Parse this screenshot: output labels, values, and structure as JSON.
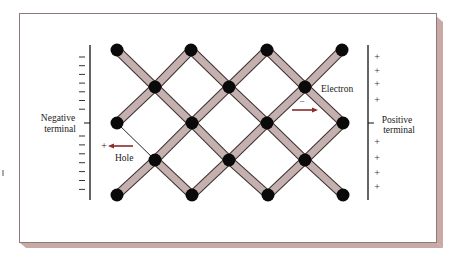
{
  "figure": {
    "labels": {
      "negative_terminal_line1": "Negative",
      "negative_terminal_line2": "terminal",
      "positive_terminal_line1": "Positive",
      "positive_terminal_line2": "terminal",
      "electron": "Electron",
      "hole": "Hole",
      "electron_sign": "–",
      "hole_sign": "+"
    },
    "negative_plate": {
      "sign": "–",
      "count_above": 7,
      "count_below": 7
    },
    "positive_plate": {
      "sign": "+",
      "count_above": 4,
      "count_below": 4
    },
    "colors": {
      "bond_fill": "#c4b0ae",
      "bond_edge": "#3a2e2e",
      "atom": "#0a0a0a",
      "arrow": "#8b2a2a",
      "frame_shadow": "#c9a9a6",
      "frame_line": "#8a7a78"
    },
    "lattice": {
      "atoms": [
        [
          117,
          50
        ],
        [
          191,
          50
        ],
        [
          267,
          50
        ],
        [
          342,
          50
        ],
        [
          155,
          87
        ],
        [
          229,
          87
        ],
        [
          305,
          87
        ],
        [
          117,
          123
        ],
        [
          192,
          123
        ],
        [
          267,
          123
        ],
        [
          343,
          123
        ],
        [
          155,
          160
        ],
        [
          229,
          160
        ],
        [
          305,
          160
        ],
        [
          117,
          195
        ],
        [
          192,
          195
        ],
        [
          268,
          195
        ],
        [
          343,
          195
        ]
      ],
      "broken_bond": [
        [
          117,
          123
        ],
        [
          155,
          160
        ]
      ]
    }
  }
}
